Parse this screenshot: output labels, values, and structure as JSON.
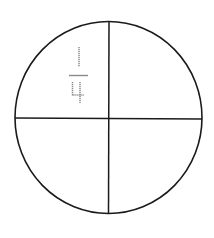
{
  "diagram": {
    "shape": "circle",
    "parts": 4,
    "stroke_color": "#1a1a1a",
    "label_color": "#8a8a8a",
    "quadrants": [
      {
        "position": "top-left",
        "label": "1/4",
        "numerator": "1",
        "denominator": "4"
      },
      {
        "position": "top-right",
        "label": ""
      },
      {
        "position": "bottom-left",
        "label": ""
      },
      {
        "position": "bottom-right",
        "label": ""
      }
    ]
  }
}
